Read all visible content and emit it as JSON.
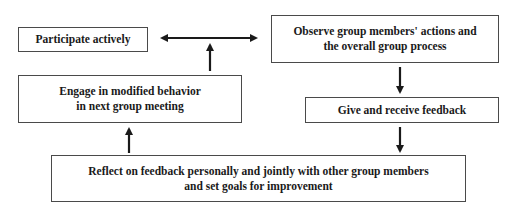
{
  "diagram": {
    "type": "cyclic-flowchart",
    "nodes": [
      {
        "id": "participate",
        "lines": [
          "Participate actively"
        ]
      },
      {
        "id": "observe",
        "lines": [
          "Observe group members' actions and",
          "the overall group process"
        ]
      },
      {
        "id": "feedback",
        "lines": [
          "Give and receive feedback"
        ]
      },
      {
        "id": "reflect",
        "lines": [
          "Reflect on feedback personally and jointly with other group members",
          "and set goals for improvement"
        ]
      },
      {
        "id": "engage",
        "lines": [
          "Engage in modified behavior",
          "in next group meeting"
        ]
      }
    ],
    "edges": [
      {
        "from": "participate",
        "to": "observe",
        "style": "bidirectional-arrow"
      },
      {
        "from": "observe",
        "to": "feedback",
        "style": "arrow-down"
      },
      {
        "from": "feedback",
        "to": "reflect",
        "style": "arrow-down"
      },
      {
        "from": "reflect",
        "to": "engage",
        "style": "arrow-up"
      },
      {
        "from": "engage",
        "to": "participate-observe-link",
        "style": "arrow-up"
      }
    ],
    "colors": {
      "border": "#4a4a4a",
      "arrow": "#1a1a1a",
      "text": "#1a1a1a",
      "background": "#ffffff"
    }
  }
}
